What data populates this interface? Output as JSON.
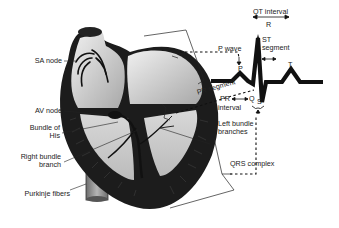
{
  "diagram": {
    "heart_labels": {
      "sa_node": "SA node",
      "av_node": "AV node",
      "bundle_of_his_line1": "Bundle of",
      "bundle_of_his_line2": "His",
      "right_bundle_line1": "Right bundle",
      "right_bundle_line2": "branch",
      "purkinje": "Purkinje fibers",
      "left_bundle_line1": "Left bundle",
      "left_bundle_line2": "branches"
    },
    "ecg_labels": {
      "qt_interval": "QT interval",
      "r": "R",
      "st_line1": "ST",
      "st_line2": "segment",
      "p_wave": "P wave",
      "p": "P",
      "t": "T",
      "pr_segment": "PR segment",
      "q": "Q",
      "s": "S",
      "pr_interval_line1": "PR",
      "pr_interval_line2": "interval",
      "qrs_complex": "QRS complex"
    },
    "colors": {
      "ink": "#111111",
      "heart_fill_light": "#e6e6e6",
      "heart_fill_dark": "#9a9a9a",
      "muscle": "#1c1c1c",
      "vessel": "#8a8a8a"
    }
  }
}
